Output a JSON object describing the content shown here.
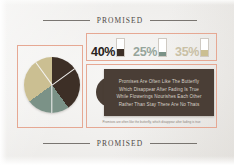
{
  "slide": {
    "background_color": "#f2f1ef",
    "frame_color": "#e6a893"
  },
  "header": {
    "label": "PROMISED"
  },
  "footer": {
    "label": "PROMISED"
  },
  "stats": {
    "items": [
      {
        "value": "40%",
        "color": "#3d2f26",
        "fill_ratio": "42%",
        "text_color": "#272220",
        "name": "brown"
      },
      {
        "value": "25%",
        "color": "#7b9287",
        "fill_ratio": "26%",
        "text_color": "#96a59b",
        "name": "sage-green"
      },
      {
        "value": "35%",
        "color": "#cbbf92",
        "fill_ratio": "34%",
        "text_color": "#c9c0a5",
        "name": "khaki"
      }
    ]
  },
  "quote": {
    "lines": [
      "Promises Are Often Like The Butterfly",
      "Which Disappear After Fading Is True",
      "While Flowerings Nourishes Each Other",
      "Rather Than Stay  There Are No Thats"
    ],
    "caption": "Promises are often like the butterfly, which disappear after fading is true"
  },
  "chart_data": {
    "type": "pie",
    "title": "PROMISED",
    "categories": [
      "40%",
      "25%",
      "35%"
    ],
    "values": [
      40,
      25,
      35
    ],
    "colors": [
      "#3d2f26",
      "#7b9287",
      "#cbbf92"
    ],
    "legend": "inline-swatches",
    "grid": false
  }
}
